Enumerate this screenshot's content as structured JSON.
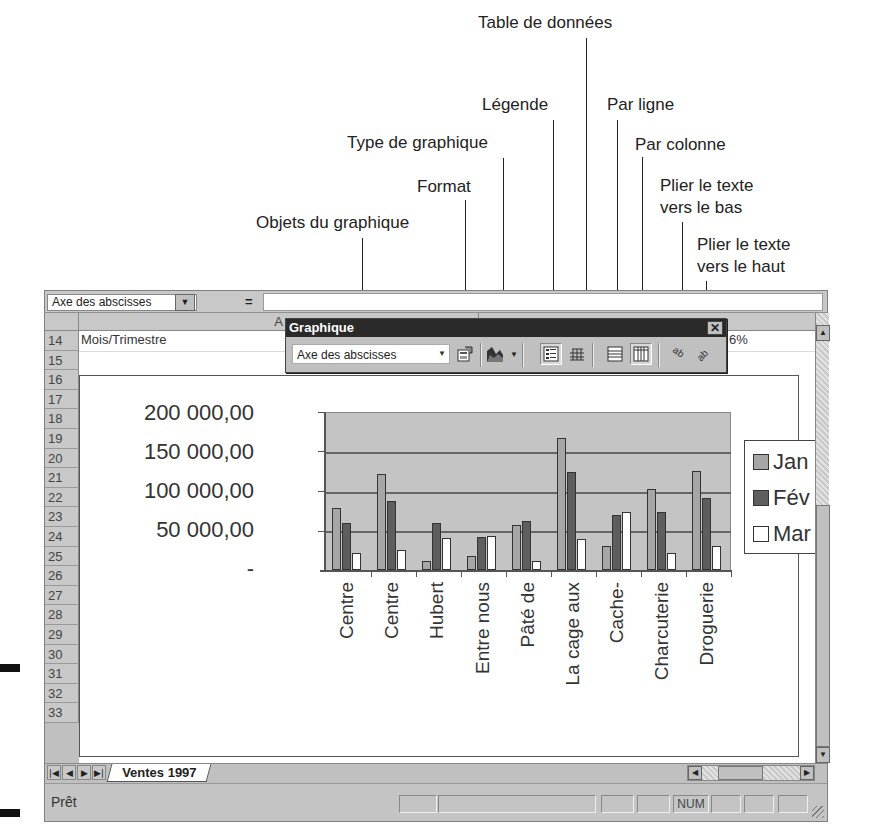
{
  "callouts": [
    {
      "id": "table-de-donnees",
      "text": "Table de données"
    },
    {
      "id": "legende",
      "text": "Légende"
    },
    {
      "id": "par-ligne",
      "text": "Par ligne"
    },
    {
      "id": "type-de-graphique",
      "text": "Type de graphique"
    },
    {
      "id": "par-colonne",
      "text": "Par colonne"
    },
    {
      "id": "format",
      "text": "Format"
    },
    {
      "id": "plier-bas-1",
      "text": "Plier le texte"
    },
    {
      "id": "plier-bas-2",
      "text": "vers le bas"
    },
    {
      "id": "objets-du-graphique",
      "text": "Objets du graphique"
    },
    {
      "id": "plier-haut-1",
      "text": "Plier le texte"
    },
    {
      "id": "plier-haut-2",
      "text": "vers le haut"
    }
  ],
  "formula_bar": {
    "name_box": "Axe des abscisses",
    "equals": "="
  },
  "columns": [
    "A"
  ],
  "rows": [
    "14",
    "15",
    "16",
    "17",
    "18",
    "19",
    "20",
    "21",
    "22",
    "23",
    "24",
    "25",
    "26",
    "27",
    "28",
    "29",
    "30",
    "31",
    "32",
    "33"
  ],
  "cells": {
    "A14": "Mois/Trimestre",
    "partial_pct": "6%"
  },
  "toolbar": {
    "title": "Graphique",
    "close": "✕",
    "chart_objects_value": "Axe des abscisses",
    "buttons": [
      "format",
      "chart-type",
      "legend",
      "data-table",
      "by-row",
      "by-column",
      "angle-text-downward",
      "angle-text-upward"
    ]
  },
  "chart_data": {
    "type": "bar",
    "title": "",
    "xlabel": "",
    "ylabel": "",
    "ylim": [
      0,
      200000
    ],
    "y_ticks": [
      "200 000,00",
      "150 000,00",
      "100 000,00",
      "50 000,00",
      "-"
    ],
    "grid": true,
    "legend_position": "right",
    "categories": [
      "Centre",
      "Centre",
      "Hubert",
      "Entre nous",
      "Pâté de",
      "La cage aux",
      "Cache-",
      "Charcuterie",
      "Droguerie"
    ],
    "series": [
      {
        "name": "Jan",
        "color": "#a6a6a6",
        "values": [
          79000,
          121000,
          12000,
          18000,
          57000,
          167000,
          30000,
          102000,
          125000
        ]
      },
      {
        "name": "Fév",
        "color": "#5e5e5e",
        "values": [
          59000,
          87000,
          59000,
          42000,
          62000,
          124000,
          70000,
          73000,
          91000
        ]
      },
      {
        "name": "Mar",
        "color": "#ffffff",
        "values": [
          21000,
          25000,
          41000,
          43000,
          11000,
          39000,
          73000,
          21000,
          30000
        ]
      }
    ]
  },
  "sheet_tabs": [
    {
      "label": "Ventes 1997",
      "active": true
    }
  ],
  "status": {
    "text": "Prêt",
    "num": "NUM"
  }
}
